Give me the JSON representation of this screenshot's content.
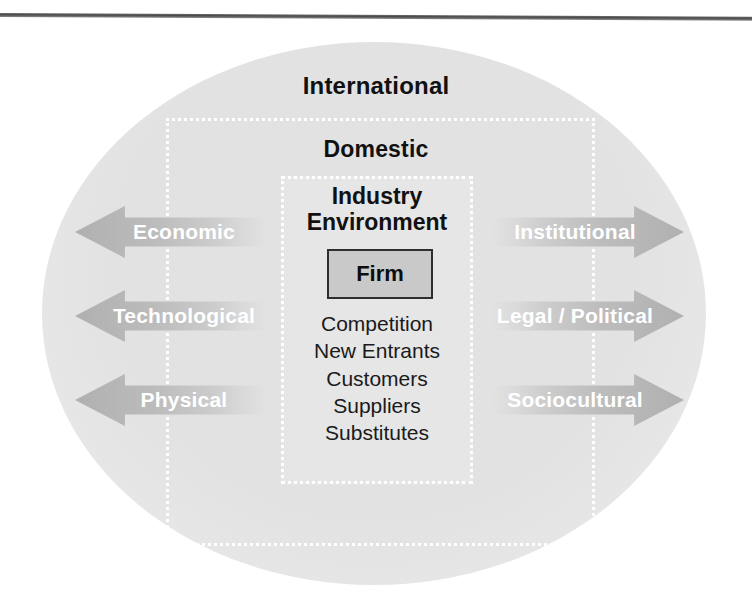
{
  "figure": {
    "rings": {
      "outer_label": "International",
      "middle_label": "Domestic",
      "inner_label": "Industry\nEnvironment"
    },
    "core": {
      "firm_label": "Firm"
    },
    "forces": [
      "Competition",
      "New Entrants",
      "Customers",
      "Suppliers",
      "Substitutes"
    ],
    "left_arrows": [
      {
        "label": "Economic",
        "direction": "left"
      },
      {
        "label": "Technological",
        "direction": "left"
      },
      {
        "label": "Physical",
        "direction": "left"
      }
    ],
    "right_arrows": [
      {
        "label": "Institutional",
        "direction": "right"
      },
      {
        "label": "Legal / Political",
        "direction": "right"
      },
      {
        "label": "Sociocultural",
        "direction": "right"
      }
    ],
    "colors": {
      "ellipse_fill": "#e2e2e2",
      "dotted_border": "#ffffff",
      "arrow_fill": "#b9b9b9",
      "arrow_text": "#ffffff",
      "firm_fill": "#c9c9c9",
      "firm_border": "#2e2e2e",
      "heading_text": "#111111",
      "rule": "#4a4a4a"
    }
  }
}
